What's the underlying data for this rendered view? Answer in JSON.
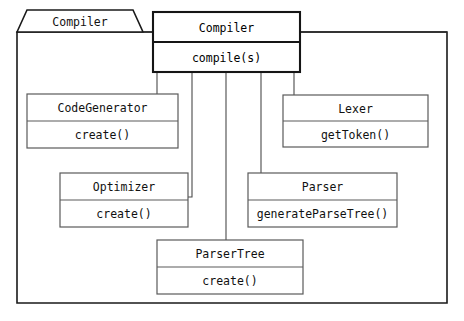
{
  "diagram": {
    "kind": "uml-class-diagram",
    "package": {
      "name": "Compiler",
      "tab": {
        "x": 17,
        "y": 10,
        "width": 126,
        "height": 22,
        "slant": 10
      },
      "frame": {
        "x": 17,
        "y": 32,
        "width": 430,
        "height": 271
      }
    },
    "colors": {
      "background": "#ffffff",
      "frame_stroke": "#1a1a1a",
      "box_stroke": "#5a5a5a",
      "main_box_stroke": "#151515",
      "connector": "#4a4a4a",
      "text": "#111111"
    },
    "classes": [
      {
        "id": "compiler",
        "name": "Compiler",
        "operation": "compile(s)",
        "emphasis": true,
        "x": 153,
        "y": 12,
        "width": 147,
        "height": 60,
        "header_height": 30
      },
      {
        "id": "code-generator",
        "name": "CodeGenerator",
        "operation": "create()",
        "emphasis": false,
        "x": 27,
        "y": 94,
        "width": 151,
        "height": 54,
        "header_height": 27
      },
      {
        "id": "lexer",
        "name": "Lexer",
        "operation": "getToken()",
        "emphasis": false,
        "x": 283,
        "y": 95,
        "width": 145,
        "height": 52,
        "header_height": 26
      },
      {
        "id": "optimizer",
        "name": "Optimizer",
        "operation": "create()",
        "emphasis": false,
        "x": 60,
        "y": 173,
        "width": 128,
        "height": 54,
        "header_height": 27
      },
      {
        "id": "parser",
        "name": "Parser",
        "operation": "generateParseTree()",
        "emphasis": false,
        "x": 248,
        "y": 173,
        "width": 149,
        "height": 54,
        "header_height": 27
      },
      {
        "id": "parser-tree",
        "name": "ParserTree",
        "operation": "create()",
        "emphasis": false,
        "x": 157,
        "y": 240,
        "width": 146,
        "height": 54,
        "header_height": 27
      }
    ],
    "connectors": [
      {
        "id": "compiler-to-code-generator",
        "from": "compiler",
        "to": "code-generator",
        "path": "M 157 72 L 157 94"
      },
      {
        "id": "compiler-to-optimizer",
        "from": "compiler",
        "to": "optimizer",
        "path": "M 192 72 L 192 197 L 188 197"
      },
      {
        "id": "compiler-to-parser-tree",
        "from": "compiler",
        "to": "parser-tree",
        "path": "M 226 72 L 226 240"
      },
      {
        "id": "compiler-to-parser",
        "from": "compiler",
        "to": "parser",
        "path": "M 261 72 L 261 173"
      },
      {
        "id": "compiler-to-lexer",
        "from": "compiler",
        "to": "lexer",
        "path": "M 294 72 L 294 95"
      },
      {
        "id": "package-frame-to-compiler-left",
        "from": "package",
        "to": "compiler",
        "path": "M 143 32 L 153 32"
      },
      {
        "id": "package-frame-to-compiler-right",
        "from": "package",
        "to": "frame",
        "path": "M 300 32 L 447 32"
      }
    ]
  }
}
